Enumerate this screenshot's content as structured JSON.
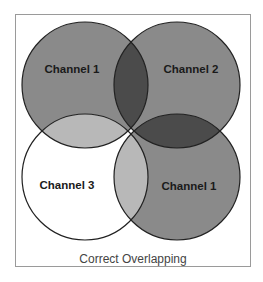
{
  "diagram": {
    "caption": "Correct Overlapping",
    "colors": {
      "channel_fill": "#8a8a8a",
      "overlap_dark": "#4b4b4b",
      "overlap_light": "#b8b8b8",
      "white_fill": "#ffffff",
      "stroke": "#222222",
      "frame": "#9a9a9a"
    },
    "circles": [
      {
        "label": "Channel 1",
        "position": "top-left"
      },
      {
        "label": "Channel 2",
        "position": "top-right"
      },
      {
        "label": "Channel 3",
        "position": "bottom-left"
      },
      {
        "label": "Channel 1",
        "position": "bottom-right"
      }
    ]
  }
}
